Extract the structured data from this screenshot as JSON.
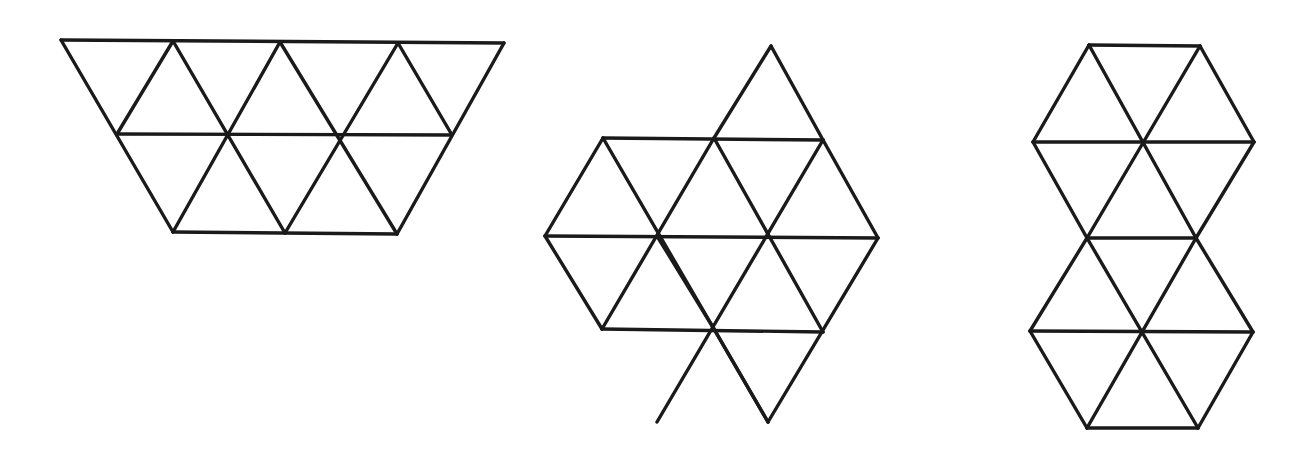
{
  "diagram": {
    "background": "#ffffff",
    "stroke_color": "#1a1a1a",
    "figures": [
      {
        "id": "trapezoid-figure",
        "triangle_count": 12,
        "edges": [
          [
            61,
            40,
            504,
            43
          ],
          [
            117,
            134,
            452,
            135
          ],
          [
            173,
            232,
            397,
            234
          ],
          [
            61,
            40,
            173,
            232
          ],
          [
            504,
            43,
            397,
            234
          ],
          [
            173,
            41,
            117,
            134
          ],
          [
            173,
            41,
            285,
            233
          ],
          [
            280,
            42,
            173,
            232
          ],
          [
            280,
            42,
            397,
            234
          ],
          [
            398,
            43,
            285,
            233
          ],
          [
            398,
            43,
            452,
            135
          ]
        ]
      },
      {
        "id": "hexagon-with-diamonds-figure",
        "triangle_count": 12,
        "edges": [
          [
            771,
            46,
            714,
            138
          ],
          [
            771,
            46,
            823,
            140
          ],
          [
            603,
            138,
            823,
            140
          ],
          [
            545,
            236,
            878,
            238
          ],
          [
            602,
            329,
            823,
            332
          ],
          [
            603,
            138,
            545,
            236
          ],
          [
            545,
            236,
            602,
            329
          ],
          [
            603,
            138,
            768,
            422
          ],
          [
            714,
            138,
            602,
            329
          ],
          [
            714,
            138,
            823,
            332
          ],
          [
            823,
            140,
            657,
            422
          ],
          [
            823,
            140,
            878,
            238
          ],
          [
            878,
            238,
            768,
            422
          ],
          [
            657,
            236,
            714,
            329
          ],
          [
            714,
            329,
            768,
            422
          ]
        ]
      },
      {
        "id": "stacked-hexagons-figure",
        "triangle_count": 12,
        "edges": [
          [
            1089,
            45,
            1200,
            46
          ],
          [
            1033,
            142,
            1254,
            142
          ],
          [
            1087,
            238,
            1196,
            238
          ],
          [
            1030,
            331,
            1253,
            332
          ],
          [
            1087,
            428,
            1198,
            428
          ],
          [
            1089,
            45,
            1033,
            142
          ],
          [
            1200,
            46,
            1254,
            142
          ],
          [
            1089,
            45,
            1196,
            238
          ],
          [
            1200,
            46,
            1087,
            238
          ],
          [
            1033,
            142,
            1087,
            238
          ],
          [
            1254,
            142,
            1196,
            238
          ],
          [
            1087,
            238,
            1198,
            428
          ],
          [
            1196,
            238,
            1087,
            428
          ],
          [
            1087,
            238,
            1030,
            331
          ],
          [
            1196,
            238,
            1253,
            332
          ],
          [
            1030,
            331,
            1087,
            428
          ],
          [
            1253,
            332,
            1198,
            428
          ]
        ]
      }
    ]
  }
}
